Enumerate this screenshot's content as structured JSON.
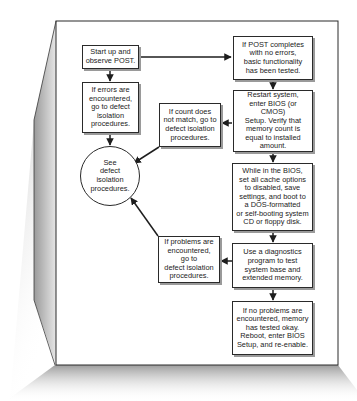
{
  "diagram": {
    "type": "flowchart",
    "topic": "Memory testing procedure",
    "nodes": {
      "start": {
        "text": "Start up and\nobserve POST."
      },
      "errors": {
        "text": "If errors are\nencountered,\ngo to defect\nisolation\nprocedures."
      },
      "post_ok": {
        "text": "If POST completes\nwith no errors,\nbasic functionality\nhas been tested."
      },
      "restart": {
        "text": "Restart system,\nenter BIOS (or CMOS)\nSetup. Verify that\nmemory count is\nequal to installed\namount."
      },
      "count_mismatch": {
        "text": "If count does\nnot match, go to\ndefect isolation\nprocedures."
      },
      "see_defect": {
        "text": "See\ndefect\nisolation\nprocedures."
      },
      "bios_cache": {
        "text": "While in the BIOS,\nset all cache options\nto disabled, save\nsettings, and boot to\na DOS-formatted\nor self-booting system\nCD or floppy disk."
      },
      "problems": {
        "text": "If problems are\nencountered,\ngo to\ndefect isolation\nprocedures."
      },
      "diagnostics": {
        "text": "Use a diagnostics\nprogram to test\nsystem base and\nextended memory."
      },
      "no_problems": {
        "text": "If no problems are\nencountered, memory\nhas tested okay.\nReboot, enter BIOS\nSetup, and re-enable."
      }
    },
    "edges": [
      {
        "from": "start",
        "to": "post_ok"
      },
      {
        "from": "start",
        "to": "errors"
      },
      {
        "from": "errors",
        "to": "see_defect"
      },
      {
        "from": "post_ok",
        "to": "restart"
      },
      {
        "from": "restart",
        "to": "count_mismatch"
      },
      {
        "from": "count_mismatch",
        "to": "see_defect"
      },
      {
        "from": "restart",
        "to": "bios_cache"
      },
      {
        "from": "bios_cache",
        "to": "diagnostics"
      },
      {
        "from": "diagnostics",
        "to": "problems"
      },
      {
        "from": "problems",
        "to": "see_defect"
      },
      {
        "from": "diagnostics",
        "to": "no_problems"
      }
    ],
    "colors": {
      "line": "#1e1e1e",
      "page": "#ffffff",
      "shadow": "#8c8c8c"
    }
  }
}
